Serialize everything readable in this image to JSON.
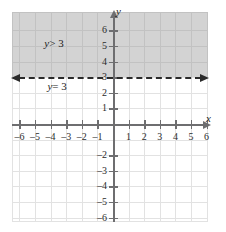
{
  "chart_data": {
    "type": "line",
    "title": "",
    "xlabel": "x",
    "ylabel": "y",
    "xlim": [
      -6.8,
      6.8
    ],
    "ylim": [
      -6.8,
      6.8
    ],
    "grid": true,
    "legend": null,
    "x_ticks": [
      -6,
      -5,
      -4,
      -3,
      -2,
      -1,
      1,
      2,
      3,
      4,
      5,
      6
    ],
    "y_ticks": [
      6,
      5,
      4,
      3,
      2,
      1,
      -2,
      -3,
      -4,
      -5,
      -6
    ],
    "x_tick_labels": [
      "–6",
      "–5",
      "–4",
      "–3",
      "–2",
      "–1",
      "1",
      "2",
      "3",
      "4",
      "5",
      "6"
    ],
    "y_tick_labels": [
      "6",
      "5",
      "4",
      "3",
      "2",
      "1",
      "–2",
      "–3",
      "–4",
      "–5",
      "–6"
    ],
    "boundary_line": {
      "equation": "y = 3",
      "style": "dashed",
      "y_value": 3,
      "label": "y = 3",
      "label_variable": "y",
      "label_rest": "= 3",
      "arrows": "both"
    },
    "shaded_region": {
      "inequality": "y > 3",
      "label": "y > 3",
      "label_variable": "y",
      "label_rest": "> 3",
      "fill_color": "#969696",
      "fill_opacity": 0.42,
      "direction": "above"
    },
    "axis_color": "#6e6e70",
    "grid_color": "#e2e2e2",
    "line_color": "#2a2a2a"
  }
}
